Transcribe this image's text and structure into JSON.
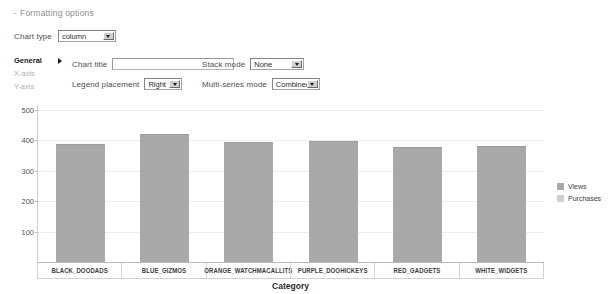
{
  "formatting": {
    "toggle_marker": "-",
    "toggle_label": "Formatting options",
    "chart_type_label": "Chart type",
    "chart_type_value": "column",
    "tabs": [
      {
        "label": "General",
        "active": true
      },
      {
        "label": "X-axis",
        "active": false
      },
      {
        "label": "Y-axis",
        "active": false
      }
    ],
    "chart_title_label": "Chart title",
    "chart_title_value": "",
    "chart_title_placeholder": "",
    "legend_placement_label": "Legend placement",
    "legend_placement_value": "Right",
    "stack_mode_label": "Stack mode",
    "stack_mode_value": "None",
    "multi_series_label": "Multi-series mode",
    "multi_series_value": "Combined"
  },
  "chart_data": {
    "type": "bar",
    "title": "",
    "xlabel": "Category",
    "ylabel": "",
    "categories": [
      "BLACK_DOODADS",
      "BLUE_GIZMOS",
      "ORANGE_WATCHMACALLITS",
      "PURPLE_DOOHICKEYS",
      "RED_GADGETS",
      "WHITE_WIDGETS"
    ],
    "series": [
      {
        "name": "Views",
        "color": "#a9a9a9",
        "values": [
          388,
          420,
          393,
          397,
          377,
          380
        ]
      },
      {
        "name": "Purchases",
        "color": "#d0d0d0",
        "values": [
          0,
          0,
          0,
          0,
          0,
          0
        ]
      }
    ],
    "yticks": [
      100,
      200,
      300,
      400,
      500
    ],
    "ytick_labels": [
      "100",
      "200",
      "300",
      "400",
      "500"
    ],
    "ylim": [
      0,
      516
    ],
    "grid": true,
    "legend_position": "right",
    "legend_entries": [
      "Views",
      "Purchases"
    ]
  }
}
